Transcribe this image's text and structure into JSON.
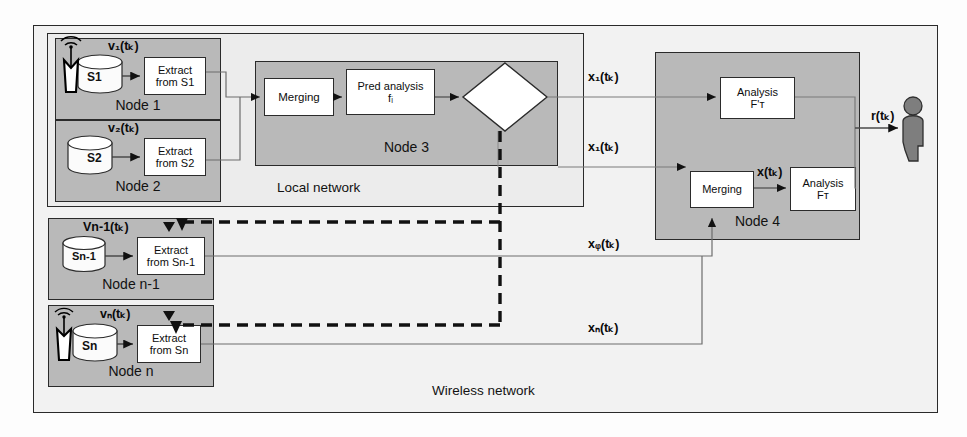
{
  "diagram": {
    "outer_frame_label": "Wireless network",
    "local_network_label": "Local network",
    "colors": {
      "node_fill": "#b9b9b9",
      "inner_box_fill": "#ffffff",
      "outer_fill": "#f2f2f2",
      "stroke": "#2a2a2a",
      "person_fill": "#808080"
    }
  },
  "nodes": [
    {
      "id": "node1",
      "name": "Node 1",
      "has_antenna": true,
      "store_label": "S1",
      "signal_label": "v₁(tₖ)",
      "process_label": "Extract\nfrom S1",
      "process_line1": "Extract",
      "process_line2": "from S1"
    },
    {
      "id": "node2",
      "name": "Node 2",
      "has_antenna": false,
      "store_label": "S2",
      "signal_label": "v₂(tₖ)",
      "process_line1": "Extract",
      "process_line2": "from S2"
    },
    {
      "id": "node_n_minus_1",
      "name": "Node n-1",
      "has_antenna": false,
      "store_label": "Sn-1",
      "signal_label": "Vn-1(tₖ)",
      "process_line1": "Extract",
      "process_line2": "from Sn-1"
    },
    {
      "id": "node_n",
      "name": "Node n",
      "has_antenna": true,
      "store_label": "Sn",
      "signal_label": "vₙ(tₖ)",
      "process_line1": "Extract",
      "process_line2": "from Sn"
    },
    {
      "id": "node3",
      "name": "Node 3",
      "blocks": [
        {
          "id": "merging3",
          "line1": "Merging",
          "line2": ""
        },
        {
          "id": "pred-analysis",
          "line1": "Pred analysis",
          "line2": "fᵢ"
        }
      ],
      "decision": {
        "id": "need-decision",
        "line1": "Need?",
        "line2": "cᵢ(tₖ)"
      }
    },
    {
      "id": "node4",
      "name": "Node 4",
      "blocks": [
        {
          "id": "analysis-fprime",
          "line1": "Analysis",
          "line2": "F'ᴛ"
        },
        {
          "id": "merging4",
          "line1": "Merging",
          "line2": ""
        },
        {
          "id": "analysis-f",
          "line1": "Analysis",
          "line2": "Fᴛ"
        }
      ]
    }
  ],
  "signals": {
    "x1_top": "x₁(tₖ)",
    "x1_bottom": "x₁(tₖ)",
    "xq": "xᵩ(tₖ)",
    "xn": "xₙ(tₖ)",
    "x_merged": "x(tₖ)",
    "result": "r(tₖ)"
  },
  "actor": {
    "name": "user-figure",
    "label": ""
  }
}
